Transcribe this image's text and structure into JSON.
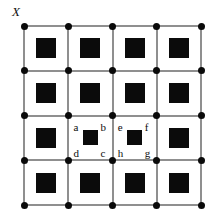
{
  "figure": {
    "title": "",
    "axis_label": "X",
    "background_color": "#ffffff",
    "line_color": "#8f8f8f",
    "node_color": "#0a0a0a",
    "square_color": "#0b0b0b",
    "label_color": "#0d0d0d"
  },
  "grid": {
    "rows": 4,
    "cols": 4,
    "node_rows": 5,
    "node_cols": 5,
    "origin_x": 24,
    "origin_y": 26,
    "cell_width": 44.25,
    "cell_height": 44.75,
    "node_diameter": 7,
    "line_width": 2,
    "square_size": 20,
    "labeled_square_size": 15
  },
  "cells": [
    {
      "row": 0,
      "col": 0,
      "labeled": false
    },
    {
      "row": 0,
      "col": 1,
      "labeled": false
    },
    {
      "row": 0,
      "col": 2,
      "labeled": false
    },
    {
      "row": 0,
      "col": 3,
      "labeled": false
    },
    {
      "row": 1,
      "col": 0,
      "labeled": false
    },
    {
      "row": 1,
      "col": 1,
      "labeled": false
    },
    {
      "row": 1,
      "col": 2,
      "labeled": false
    },
    {
      "row": 1,
      "col": 3,
      "labeled": false
    },
    {
      "row": 2,
      "col": 0,
      "labeled": false
    },
    {
      "row": 2,
      "col": 1,
      "labeled": true,
      "corner_labels": {
        "top_left": "a",
        "top_right": "b",
        "bottom_right": "c",
        "bottom_left": "d"
      }
    },
    {
      "row": 2,
      "col": 2,
      "labeled": true,
      "corner_labels": {
        "top_left": "e",
        "top_right": "f",
        "bottom_right": "g",
        "bottom_left": "h"
      }
    },
    {
      "row": 2,
      "col": 3,
      "labeled": false
    },
    {
      "row": 3,
      "col": 0,
      "labeled": false
    },
    {
      "row": 3,
      "col": 1,
      "labeled": false
    },
    {
      "row": 3,
      "col": 2,
      "labeled": false
    },
    {
      "row": 3,
      "col": 3,
      "labeled": false
    }
  ],
  "labels": [
    "a",
    "b",
    "c",
    "d",
    "e",
    "f",
    "g",
    "h"
  ]
}
